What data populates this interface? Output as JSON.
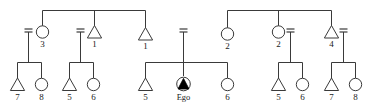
{
  "diagram": {
    "type": "genealogy-kinship-diagram",
    "ego_label": "Ego",
    "colors": {
      "line": "#3a3a3a",
      "label": "#1a1a1a",
      "fill": "#ffffff",
      "background": "#ffffff",
      "ego_fill": "#000000"
    },
    "symbols": {
      "triangle": "male",
      "circle": "female",
      "filled-triangle-in-circle": "ego",
      "double-dash": "marriage-tie"
    },
    "generation2": [
      {
        "id": "g2-1",
        "shape": "circle",
        "label": "3",
        "marriage": "left"
      },
      {
        "id": "g2-2",
        "shape": "triangle",
        "label": "1",
        "marriage": "left"
      },
      {
        "id": "g2-3",
        "shape": "triangle",
        "label": "1",
        "marriage": "none"
      },
      {
        "id": "g2-4",
        "shape": "circle",
        "label": "2",
        "marriage": "none"
      },
      {
        "id": "g2-5",
        "shape": "circle",
        "label": "2",
        "marriage": "right"
      },
      {
        "id": "g2-6",
        "shape": "triangle",
        "label": "4",
        "marriage": "right"
      }
    ],
    "generation3": [
      {
        "id": "g3-1",
        "shape": "triangle",
        "label": "7"
      },
      {
        "id": "g3-2",
        "shape": "circle",
        "label": "8"
      },
      {
        "id": "g3-3",
        "shape": "triangle",
        "label": "5"
      },
      {
        "id": "g3-4",
        "shape": "circle",
        "label": "6"
      },
      {
        "id": "g3-5",
        "shape": "triangle",
        "label": "5"
      },
      {
        "id": "g3-6",
        "shape": "ego",
        "label": "Ego"
      },
      {
        "id": "g3-7",
        "shape": "circle",
        "label": "6"
      },
      {
        "id": "g3-8",
        "shape": "triangle",
        "label": "5"
      },
      {
        "id": "g3-9",
        "shape": "circle",
        "label": "6"
      },
      {
        "id": "g3-10",
        "shape": "triangle",
        "label": "7"
      },
      {
        "id": "g3-11",
        "shape": "circle",
        "label": "8"
      }
    ]
  }
}
